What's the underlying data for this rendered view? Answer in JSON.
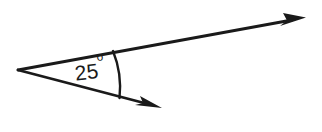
{
  "figure": {
    "background_color": "#ffffff",
    "stroke_color": "#1a1a1a",
    "stroke_width": 2.6
  },
  "angle": {
    "value": "25",
    "degree_symbol": "o",
    "full_label": "25°",
    "measure_degrees": 25,
    "vertex": {
      "x": 18,
      "y": 70
    },
    "label_position": {
      "x": 90,
      "y": 73
    },
    "label_rotation_degrees": -7
  },
  "rays": [
    {
      "name": "upper-ray",
      "from": {
        "x": 18,
        "y": 70
      },
      "to": {
        "x": 305,
        "y": 18
      },
      "arrowhead": "end",
      "direction": "up-right"
    },
    {
      "name": "lower-ray",
      "from": {
        "x": 18,
        "y": 70
      },
      "to": {
        "x": 161,
        "y": 108
      },
      "arrowhead": "end",
      "direction": "down-right"
    }
  ],
  "arc": {
    "name": "angle-arc",
    "start": {
      "x": 113,
      "y": 52
    },
    "end": {
      "x": 119,
      "y": 97
    },
    "radius": 97,
    "sweep": "clockwise"
  }
}
